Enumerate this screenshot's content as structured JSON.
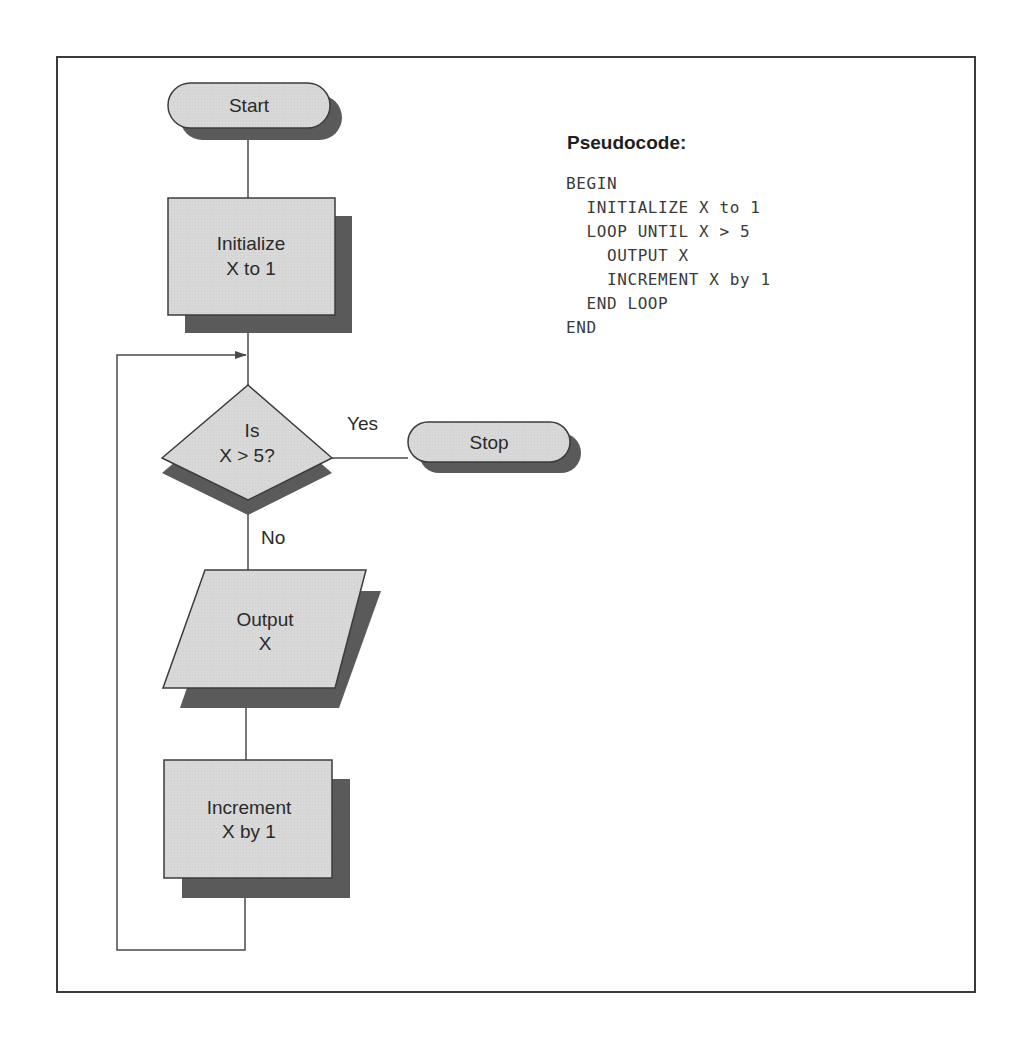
{
  "diagram": {
    "type": "flowchart",
    "colors": {
      "frame": "#3a3a3a",
      "shape_fill": "#d6d6d6",
      "shape_stroke": "#3c3c3c",
      "shadow": "#5a5a5a",
      "connector": "#4a4a4a",
      "text": "#2a2a2a"
    },
    "nodes": {
      "start": {
        "shape": "terminator",
        "label": "Start"
      },
      "initialize": {
        "shape": "process",
        "lines": [
          "Initialize",
          "X to 1"
        ]
      },
      "decision": {
        "shape": "decision",
        "lines": [
          "Is",
          "X > 5?"
        ]
      },
      "stop": {
        "shape": "terminator",
        "label": "Stop"
      },
      "output": {
        "shape": "input-output",
        "lines": [
          "Output",
          "X"
        ]
      },
      "increment": {
        "shape": "process",
        "lines": [
          "Increment",
          "X by 1"
        ]
      }
    },
    "edges": [
      {
        "from": "start",
        "to": "initialize",
        "label": ""
      },
      {
        "from": "initialize",
        "to": "decision",
        "label": ""
      },
      {
        "from": "decision",
        "to": "stop",
        "label": "Yes"
      },
      {
        "from": "decision",
        "to": "output",
        "label": "No"
      },
      {
        "from": "output",
        "to": "increment",
        "label": ""
      },
      {
        "from": "increment",
        "to": "decision",
        "label": ""
      }
    ],
    "branch_labels": {
      "yes": "Yes",
      "no": "No"
    }
  },
  "pseudocode": {
    "title": "Pseudocode:",
    "lines": [
      "BEGIN",
      "  INITIALIZE X to 1",
      "  LOOP UNTIL X > 5",
      "    OUTPUT X",
      "    INCREMENT X by 1",
      "  END LOOP",
      "END"
    ]
  }
}
